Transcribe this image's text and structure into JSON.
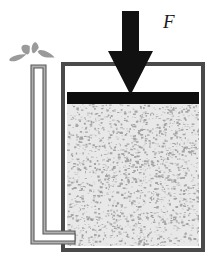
{
  "figure": {
    "kind": "physics-diagram",
    "background_color": "#ffffff"
  },
  "labels": {
    "force": {
      "text": "F",
      "x": 163,
      "y": 12,
      "color": "#1a1a1a",
      "font_size_px": 19,
      "style": "italic-serif"
    }
  },
  "colors": {
    "outline": "#4a4a4a",
    "container_wall": "#808080",
    "piston_black": "#0d0d0d",
    "arrow_black": "#111111",
    "granular_fill": "#e8e8e8",
    "granular_speck": "#8a8a8a",
    "tube_wall": "#b0b0b0",
    "tube_wall_edge": "#5a5a5a",
    "tube_interior": "#ffffff",
    "spray_droplet": "#9a9a9a"
  },
  "container": {
    "name": "container",
    "x": 63,
    "y": 64,
    "width": 140,
    "height": 186,
    "wall_thickness": 4,
    "headspace": {
      "name": "headspace-air-gap",
      "fill": "#ffffff",
      "top": 68,
      "height": 24
    }
  },
  "piston": {
    "name": "piston-plate",
    "x": 67,
    "y": 92,
    "width": 132,
    "height": 12,
    "fill": "#0d0d0d"
  },
  "granular_bed": {
    "name": "granular-material",
    "x": 67,
    "y": 104,
    "width": 132,
    "height": 142,
    "fill": "#e8e8e8",
    "speck_color": "#8a8a8a",
    "speck_count": 1100
  },
  "force_arrow": {
    "name": "force-arrow",
    "direction": "down",
    "fill": "#111111",
    "shaft": {
      "x": 122,
      "y": 11,
      "width": 17,
      "height": 41
    },
    "head": {
      "left_x": 108,
      "right_x": 153,
      "top_y": 51,
      "tip_x": 130.5,
      "tip_y": 95
    }
  },
  "side_tube": {
    "name": "side-tube",
    "shape": "L-shaped",
    "wall_color": "#b0b0b0",
    "interior_color": "#ffffff",
    "edge_color": "#5a5a5a",
    "vertical": {
      "x": 31,
      "y": 65,
      "width": 15,
      "height": 173
    },
    "horizontal": {
      "x": 31,
      "y": 231,
      "width": 44,
      "height": 13
    },
    "opening_y": 65
  },
  "spray": {
    "name": "spray-droplets",
    "color": "#9a9a9a",
    "droplets": [
      {
        "id": "droplet-left",
        "cx": 18,
        "cy": 58,
        "rx": 9,
        "ry": 4,
        "rot": -18
      },
      {
        "id": "droplet-upper-left",
        "cx": 27,
        "cy": 50,
        "rx": 4.5,
        "ry": 8,
        "rot": -34
      },
      {
        "id": "droplet-center",
        "cx": 35,
        "cy": 49,
        "rx": 3.5,
        "ry": 8.5,
        "rot": 10
      },
      {
        "id": "droplet-right",
        "cx": 46,
        "cy": 55,
        "rx": 9,
        "ry": 4.5,
        "rot": 22
      }
    ]
  }
}
